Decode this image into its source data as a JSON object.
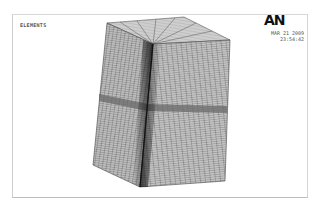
{
  "plot": {
    "label": "ELEMENTS",
    "logo": "AN",
    "date": "MAR 21 2009",
    "time": "23:54:42"
  },
  "colors": {
    "background": "#ffffff",
    "mesh_fill": "#b8b8b8",
    "mesh_line": "#555555",
    "band": "#6e6e6e"
  }
}
